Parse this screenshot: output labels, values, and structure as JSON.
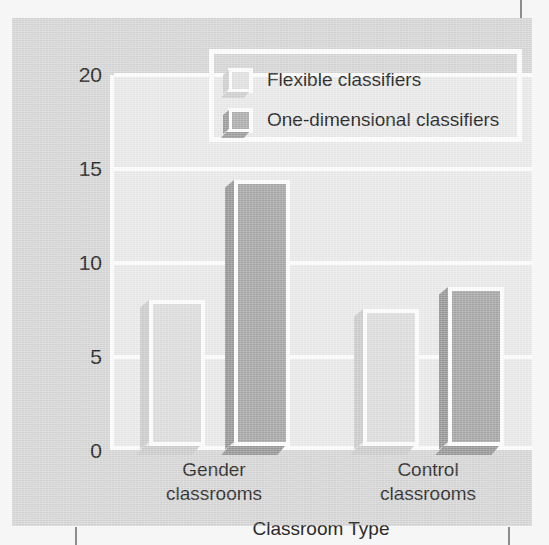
{
  "figure": {
    "background_color": "#d8d8d8",
    "plot_background_color": "#ececec",
    "gridline_color": "#ffffff"
  },
  "marks": {
    "top_right": "crop-mark",
    "bottom_left": "crop-mark",
    "bottom_right": "crop-mark"
  },
  "chart_data": {
    "type": "bar",
    "title": "",
    "xlabel": "Classroom Type",
    "ylabel": "Mean Gender Stereotyping Score",
    "categories": [
      "Gender\nclassrooms",
      "Control\nclassrooms"
    ],
    "category_labels": [
      {
        "line1": "Gender",
        "line2": "classrooms"
      },
      {
        "line1": "Control",
        "line2": "classrooms"
      }
    ],
    "series": [
      {
        "name": "Flexible classifiers",
        "values": [
          7.8,
          7.3
        ],
        "color": "#e0e0e0"
      },
      {
        "name": "One-dimensional classifiers",
        "values": [
          14.2,
          8.5
        ],
        "color": "#a9a9a9"
      }
    ],
    "ylim": [
      0,
      20
    ],
    "yticks": [
      0,
      5,
      10,
      15,
      20
    ],
    "ytick_labels": [
      "0",
      "5",
      "10",
      "15",
      "20"
    ],
    "grid": true,
    "legend_position": "top-right-inside"
  },
  "legend": {
    "items": [
      {
        "label": "Flexible classifiers",
        "swatch": "flexible"
      },
      {
        "label": "One-dimensional classifiers",
        "swatch": "onedim"
      }
    ]
  }
}
